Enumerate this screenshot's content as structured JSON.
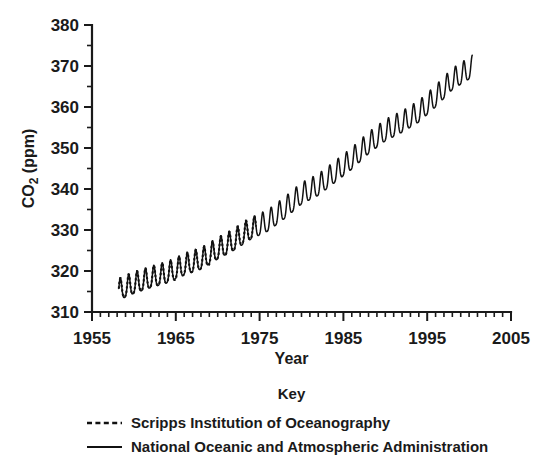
{
  "chart_data": {
    "type": "line",
    "title": "",
    "xlabel": "Year",
    "ylabel": "CO2 (ppm)",
    "ylabel_base": "CO",
    "ylabel_sub": "2",
    "ylabel_unit": " (ppm)",
    "xlim": [
      1955,
      2005
    ],
    "ylim": [
      310,
      380
    ],
    "x_major_ticks": [
      1955,
      1965,
      1975,
      1985,
      1995,
      2005
    ],
    "x_major_tick_labels": [
      "1955",
      "1965",
      "1975",
      "1985",
      "1995",
      "2005"
    ],
    "x_minor_tick_interval": 1,
    "y_major_ticks": [
      310,
      320,
      330,
      340,
      350,
      360,
      370,
      380
    ],
    "y_major_tick_labels": [
      "310",
      "320",
      "330",
      "340",
      "350",
      "360",
      "370",
      "380"
    ],
    "y_minor_tick_interval": 5,
    "grid": false,
    "legend_position": "below",
    "legend_title": "Key",
    "series": [
      {
        "name": "Scripps Institution of Oceanography",
        "style": "dashed",
        "color": "#111111",
        "x_start": 1958.2,
        "x_end": 1974.6,
        "seasonal_amplitude": 3.1,
        "seasonal_peak_month_fraction": 0.38,
        "x": [
          1958.2,
          1959,
          1960,
          1961,
          1962,
          1963,
          1964,
          1965,
          1966,
          1967,
          1968,
          1969,
          1970,
          1971,
          1972,
          1973,
          1974,
          1974.6
        ],
        "annual_mean_values": [
          315.0,
          315.8,
          316.6,
          317.3,
          318.0,
          318.6,
          319.2,
          319.9,
          321.1,
          321.8,
          322.5,
          323.5,
          325.0,
          326.0,
          327.2,
          328.8,
          329.9,
          330.4
        ]
      },
      {
        "name": "National Oceanic and Atmospheric Administration",
        "style": "solid",
        "color": "#111111",
        "x_start": 1958.2,
        "x_end": 2000.4,
        "seasonal_amplitude": 3.2,
        "seasonal_peak_month_fraction": 0.38,
        "x": [
          1958.2,
          1960,
          1962,
          1964,
          1966,
          1968,
          1970,
          1972,
          1974,
          1976,
          1978,
          1980,
          1982,
          1984,
          1986,
          1988,
          1990,
          1992,
          1994,
          1996,
          1998,
          2000,
          2000.4
        ],
        "annual_mean_values": [
          315.0,
          316.6,
          318.0,
          319.2,
          321.1,
          322.5,
          325.0,
          327.2,
          329.9,
          331.8,
          334.9,
          338.4,
          340.5,
          343.7,
          346.9,
          350.7,
          353.8,
          355.9,
          358.4,
          362.1,
          366.3,
          368.9,
          369.5
        ]
      }
    ],
    "legend_entries": [
      {
        "label": "Scripps Institution of Oceanography",
        "style": "dashed"
      },
      {
        "label": "National Oceanic and Atmospheric Administration",
        "style": "solid"
      }
    ]
  }
}
